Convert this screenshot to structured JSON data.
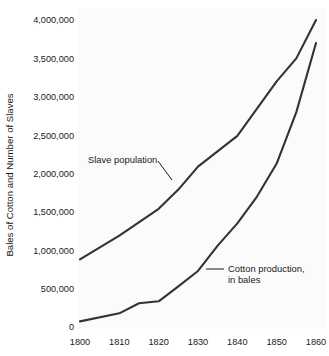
{
  "chart_data": {
    "type": "line",
    "title": "",
    "subtitle": "",
    "xlabel": "",
    "ylabel": "Bales of Cotton and Number of Slaves",
    "x": [
      1800,
      1810,
      1820,
      1830,
      1840,
      1850,
      1860
    ],
    "xlim": [
      1800,
      1860
    ],
    "ylim": [
      0,
      4000000
    ],
    "xticks": [
      "1800",
      "1810",
      "1820",
      "1830",
      "1840",
      "1850",
      "1860"
    ],
    "yticks": [
      "0",
      "500,000",
      "1,000,000",
      "1,500,000",
      "2,000,000",
      "2,500,000",
      "3,000,000",
      "3,500,000",
      "4,000,000"
    ],
    "ytick_values": [
      0,
      500000,
      1000000,
      1500000,
      2000000,
      2500000,
      3000000,
      3500000,
      4000000
    ],
    "grid": false,
    "legend_position": "inline-annotations",
    "background_color": "#ffffff",
    "line_color": "#333333",
    "series": [
      {
        "name": "Slave population",
        "label_line1": "Slave population",
        "label_line2": "",
        "color": "#333333",
        "x": [
          1800,
          1810,
          1820,
          1825,
          1830,
          1840,
          1850,
          1855,
          1860
        ],
        "values": [
          880000,
          1190000,
          1540000,
          1790000,
          2090000,
          2490000,
          3200000,
          3500000,
          4000000
        ]
      },
      {
        "name": "Cotton production, in bales",
        "label_line1": "Cotton production,",
        "label_line2": "in bales",
        "color": "#333333",
        "x": [
          1800,
          1810,
          1815,
          1820,
          1825,
          1830,
          1835,
          1840,
          1845,
          1850,
          1855,
          1860
        ],
        "values": [
          73000,
          178000,
          310000,
          335000,
          530000,
          730000,
          1060000,
          1350000,
          1700000,
          2130000,
          2800000,
          3700000
        ]
      }
    ],
    "annotations": [
      {
        "name": "slave-population-annotation",
        "text_line1": "Slave population",
        "text_line2": "",
        "text_x": 88,
        "text_y": 163,
        "leader_x1": 158,
        "leader_y1": 161,
        "leader_x2": 172,
        "leader_y2": 180
      },
      {
        "name": "cotton-production-annotation",
        "text_line1": "Cotton production,",
        "text_line2": "in bales",
        "text_x": 228,
        "text_y": 272,
        "leader_x1": 206,
        "leader_y1": 269,
        "leader_x2": 224,
        "leader_y2": 269
      }
    ]
  },
  "axes": {
    "y_axis_title": "Bales of Cotton and Number of Slaves"
  }
}
